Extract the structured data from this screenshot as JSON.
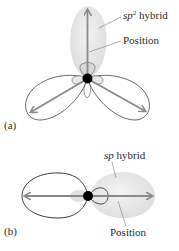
{
  "figure": {
    "panel_a": {
      "tag": "(a)",
      "hybrid_prefix": "sp",
      "hybrid_sup": "2",
      "hybrid_suffix": " hybrid",
      "position_label": "Position"
    },
    "panel_b": {
      "tag": "(b)",
      "hybrid_prefix": "sp",
      "hybrid_suffix": " hybrid",
      "position_label": "Position"
    },
    "colors": {
      "lobe_fill": "#e6e6e6",
      "outline": "#333333",
      "arrow": "#8a8a8a",
      "nucleus": "#000000"
    }
  }
}
